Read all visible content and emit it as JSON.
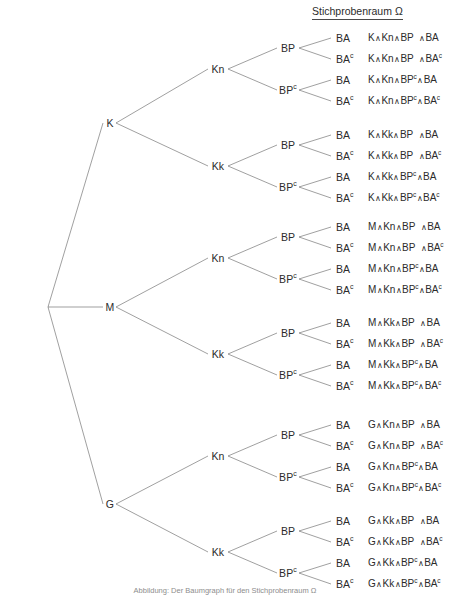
{
  "header": {
    "sample_space_title": "Stichprobenraum Ω"
  },
  "caption": {
    "text": "Abbildung: Der Baumgraph für den Stichprobenraum Ω"
  },
  "colors": {
    "line": "#777777",
    "text": "#2b2b2b",
    "background": "#ffffff",
    "caption": "#8d8d8d",
    "rule": "#4a4a4a"
  },
  "chart_data": {
    "type": "diagram",
    "subtype": "probability-tree",
    "title": "Stichprobenraum Ω",
    "levels": [
      "Wurzel",
      "K / M / G",
      "Kn / Kk",
      "BP / BP^c",
      "BA / BA^c"
    ],
    "root": {
      "x": 48,
      "y": 307
    },
    "level1": [
      {
        "label": "K",
        "sup": "",
        "x": 110,
        "y": 123
      },
      {
        "label": "M",
        "sup": "",
        "x": 110,
        "y": 307
      },
      {
        "label": "G",
        "sup": "",
        "x": 110,
        "y": 504
      }
    ],
    "level2": [
      {
        "label": "Kn",
        "sup": "",
        "x": 218,
        "y": 69
      },
      {
        "label": "Kk",
        "sup": "",
        "x": 218,
        "y": 166
      },
      {
        "label": "Kn",
        "sup": "",
        "x": 218,
        "y": 258
      },
      {
        "label": "Kk",
        "sup": "",
        "x": 218,
        "y": 354
      },
      {
        "label": "Kn",
        "sup": "",
        "x": 218,
        "y": 456
      },
      {
        "label": "Kk",
        "sup": "",
        "x": 218,
        "y": 552
      }
    ],
    "level3": [
      {
        "label": "BP",
        "sup": "",
        "x": 288,
        "y": 48
      },
      {
        "label": "BP",
        "sup": "c",
        "x": 288,
        "y": 90
      },
      {
        "label": "BP",
        "sup": "",
        "x": 288,
        "y": 145
      },
      {
        "label": "BP",
        "sup": "c",
        "x": 288,
        "y": 187
      },
      {
        "label": "BP",
        "sup": "",
        "x": 288,
        "y": 237
      },
      {
        "label": "BP",
        "sup": "c",
        "x": 288,
        "y": 279
      },
      {
        "label": "BP",
        "sup": "",
        "x": 288,
        "y": 333
      },
      {
        "label": "BP",
        "sup": "c",
        "x": 288,
        "y": 375
      },
      {
        "label": "BP",
        "sup": "",
        "x": 288,
        "y": 435
      },
      {
        "label": "BP",
        "sup": "c",
        "x": 288,
        "y": 477
      },
      {
        "label": "BP",
        "sup": "",
        "x": 288,
        "y": 531
      },
      {
        "label": "BP",
        "sup": "c",
        "x": 288,
        "y": 573
      }
    ],
    "leaves": [
      {
        "label": "BA",
        "sup": "",
        "x": 336,
        "y": 38
      },
      {
        "label": "BA",
        "sup": "c",
        "x": 336,
        "y": 59
      },
      {
        "label": "BA",
        "sup": "",
        "x": 336,
        "y": 80
      },
      {
        "label": "BA",
        "sup": "c",
        "x": 336,
        "y": 101
      },
      {
        "label": "BA",
        "sup": "",
        "x": 336,
        "y": 135
      },
      {
        "label": "BA",
        "sup": "c",
        "x": 336,
        "y": 156
      },
      {
        "label": "BA",
        "sup": "",
        "x": 336,
        "y": 177
      },
      {
        "label": "BA",
        "sup": "c",
        "x": 336,
        "y": 198
      },
      {
        "label": "BA",
        "sup": "",
        "x": 336,
        "y": 227
      },
      {
        "label": "BA",
        "sup": "c",
        "x": 336,
        "y": 248
      },
      {
        "label": "BA",
        "sup": "",
        "x": 336,
        "y": 269
      },
      {
        "label": "BA",
        "sup": "c",
        "x": 336,
        "y": 290
      },
      {
        "label": "BA",
        "sup": "",
        "x": 336,
        "y": 323
      },
      {
        "label": "BA",
        "sup": "c",
        "x": 336,
        "y": 344
      },
      {
        "label": "BA",
        "sup": "",
        "x": 336,
        "y": 365
      },
      {
        "label": "BA",
        "sup": "c",
        "x": 336,
        "y": 386
      },
      {
        "label": "BA",
        "sup": "",
        "x": 336,
        "y": 425
      },
      {
        "label": "BA",
        "sup": "c",
        "x": 336,
        "y": 446
      },
      {
        "label": "BA",
        "sup": "",
        "x": 336,
        "y": 467
      },
      {
        "label": "BA",
        "sup": "c",
        "x": 336,
        "y": 488
      },
      {
        "label": "BA",
        "sup": "",
        "x": 336,
        "y": 521
      },
      {
        "label": "BA",
        "sup": "c",
        "x": 336,
        "y": 542
      },
      {
        "label": "BA",
        "sup": "",
        "x": 336,
        "y": 563
      },
      {
        "label": "BA",
        "sup": "c",
        "x": 336,
        "y": 584
      }
    ],
    "outcomes": [
      {
        "y": 38,
        "p1": "K",
        "p2": "Kn",
        "p3": "BP",
        "p3sup": "",
        "p4": "BA",
        "p4sup": ""
      },
      {
        "y": 59,
        "p1": "K",
        "p2": "Kn",
        "p3": "BP",
        "p3sup": "",
        "p4": "BA",
        "p4sup": "c"
      },
      {
        "y": 80,
        "p1": "K",
        "p2": "Kn",
        "p3": "BP",
        "p3sup": "c",
        "p4": "BA",
        "p4sup": ""
      },
      {
        "y": 101,
        "p1": "K",
        "p2": "Kn",
        "p3": "BP",
        "p3sup": "c",
        "p4": "BA",
        "p4sup": "c"
      },
      {
        "y": 135,
        "p1": "K",
        "p2": "Kk",
        "p3": "BP",
        "p3sup": "",
        "p4": "BA",
        "p4sup": ""
      },
      {
        "y": 156,
        "p1": "K",
        "p2": "Kk",
        "p3": "BP",
        "p3sup": "",
        "p4": "BA",
        "p4sup": "c"
      },
      {
        "y": 177,
        "p1": "K",
        "p2": "Kk",
        "p3": "BP",
        "p3sup": "c",
        "p4": "BA",
        "p4sup": ""
      },
      {
        "y": 198,
        "p1": "K",
        "p2": "Kk",
        "p3": "BP",
        "p3sup": "c",
        "p4": "BA",
        "p4sup": "c"
      },
      {
        "y": 227,
        "p1": "M",
        "p2": "Kn",
        "p3": "BP",
        "p3sup": "",
        "p4": "BA",
        "p4sup": ""
      },
      {
        "y": 248,
        "p1": "M",
        "p2": "Kn",
        "p3": "BP",
        "p3sup": "",
        "p4": "BA",
        "p4sup": "c"
      },
      {
        "y": 269,
        "p1": "M",
        "p2": "Kn",
        "p3": "BP",
        "p3sup": "c",
        "p4": "BA",
        "p4sup": ""
      },
      {
        "y": 290,
        "p1": "M",
        "p2": "Kn",
        "p3": "BP",
        "p3sup": "c",
        "p4": "BA",
        "p4sup": "c"
      },
      {
        "y": 323,
        "p1": "M",
        "p2": "Kk",
        "p3": "BP",
        "p3sup": "",
        "p4": "BA",
        "p4sup": ""
      },
      {
        "y": 344,
        "p1": "M",
        "p2": "Kk",
        "p3": "BP",
        "p3sup": "",
        "p4": "BA",
        "p4sup": "c"
      },
      {
        "y": 365,
        "p1": "M",
        "p2": "Kk",
        "p3": "BP",
        "p3sup": "c",
        "p4": "BA",
        "p4sup": ""
      },
      {
        "y": 386,
        "p1": "M",
        "p2": "Kk",
        "p3": "BP",
        "p3sup": "c",
        "p4": "BA",
        "p4sup": "c"
      },
      {
        "y": 425,
        "p1": "G",
        "p2": "Kn",
        "p3": "BP",
        "p3sup": "",
        "p4": "BA",
        "p4sup": ""
      },
      {
        "y": 446,
        "p1": "G",
        "p2": "Kn",
        "p3": "BP",
        "p3sup": "",
        "p4": "BA",
        "p4sup": "c"
      },
      {
        "y": 467,
        "p1": "G",
        "p2": "Kn",
        "p3": "BP",
        "p3sup": "c",
        "p4": "BA",
        "p4sup": ""
      },
      {
        "y": 488,
        "p1": "G",
        "p2": "Kn",
        "p3": "BP",
        "p3sup": "c",
        "p4": "BA",
        "p4sup": "c"
      },
      {
        "y": 521,
        "p1": "G",
        "p2": "Kk",
        "p3": "BP",
        "p3sup": "",
        "p4": "BA",
        "p4sup": ""
      },
      {
        "y": 542,
        "p1": "G",
        "p2": "Kk",
        "p3": "BP",
        "p3sup": "",
        "p4": "BA",
        "p4sup": "c"
      },
      {
        "y": 563,
        "p1": "G",
        "p2": "Kk",
        "p3": "BP",
        "p3sup": "c",
        "p4": "BA",
        "p4sup": ""
      },
      {
        "y": 584,
        "p1": "G",
        "p2": "Kk",
        "p3": "BP",
        "p3sup": "c",
        "p4": "BA",
        "p4sup": "c"
      }
    ],
    "outcome_x": 368,
    "conjunction_symbol": "∧",
    "total_outcomes": 24
  }
}
